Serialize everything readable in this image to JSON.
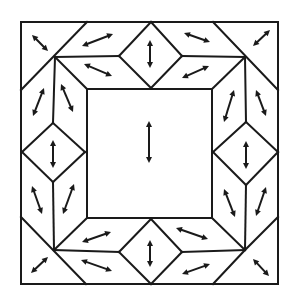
{
  "diagram": {
    "title": "",
    "colors": {
      "stroke": "#1a1a1a",
      "background": "#ffffff"
    },
    "outer_square": [
      21,
      22,
      278,
      284
    ],
    "inner_square": [
      87,
      89,
      212,
      218
    ],
    "lines": [
      [
        21,
        22,
        278,
        22
      ],
      [
        278,
        22,
        278,
        284
      ],
      [
        278,
        284,
        21,
        284
      ],
      [
        21,
        284,
        21,
        22
      ],
      [
        87,
        89,
        212,
        89
      ],
      [
        212,
        89,
        212,
        218
      ],
      [
        212,
        218,
        87,
        218
      ],
      [
        87,
        218,
        87,
        89
      ],
      [
        21,
        90,
        87,
        22
      ],
      [
        55,
        57,
        87,
        89
      ],
      [
        55,
        57,
        119,
        56
      ],
      [
        119,
        56,
        151,
        22
      ],
      [
        119,
        56,
        151,
        88
      ],
      [
        151,
        22,
        182,
        56
      ],
      [
        182,
        56,
        151,
        88
      ],
      [
        182,
        56,
        245,
        57
      ],
      [
        213,
        22,
        278,
        90
      ],
      [
        245,
        57,
        212,
        89
      ],
      [
        55,
        57,
        53,
        123
      ],
      [
        22,
        152,
        53,
        123
      ],
      [
        53,
        123,
        85,
        152
      ],
      [
        85,
        152,
        53,
        182
      ],
      [
        53,
        182,
        22,
        152
      ],
      [
        53,
        182,
        54,
        250
      ],
      [
        245,
        57,
        246,
        122
      ],
      [
        246,
        122,
        213,
        152
      ],
      [
        246,
        122,
        278,
        152
      ],
      [
        213,
        152,
        246,
        185
      ],
      [
        278,
        152,
        246,
        185
      ],
      [
        246,
        185,
        245,
        250
      ],
      [
        21,
        217,
        86,
        284
      ],
      [
        54,
        250,
        87,
        218
      ],
      [
        54,
        250,
        119,
        252
      ],
      [
        119,
        252,
        151,
        219
      ],
      [
        119,
        252,
        151,
        284
      ],
      [
        151,
        219,
        182,
        252
      ],
      [
        182,
        252,
        151,
        284
      ],
      [
        182,
        252,
        245,
        250
      ],
      [
        245,
        250,
        212,
        218
      ],
      [
        245,
        250,
        213,
        284
      ],
      [
        245,
        250,
        278,
        217
      ]
    ],
    "arrows": [
      {
        "tile": "corner-top-left",
        "from": [
          32,
          35
        ],
        "to": [
          48,
          51
        ]
      },
      {
        "tile": "top-left-outer",
        "from": [
          82,
          46
        ],
        "to": [
          113,
          34
        ]
      },
      {
        "tile": "top-left-inner",
        "from": [
          84,
          64
        ],
        "to": [
          112,
          76
        ]
      },
      {
        "tile": "top-diamond",
        "from": [
          150,
          40
        ],
        "to": [
          150,
          68
        ]
      },
      {
        "tile": "top-right-outer",
        "from": [
          184,
          33
        ],
        "to": [
          210,
          42
        ]
      },
      {
        "tile": "top-right-inner",
        "from": [
          182,
          78
        ],
        "to": [
          209,
          66
        ]
      },
      {
        "tile": "corner-top-right",
        "from": [
          253,
          46
        ],
        "to": [
          270,
          30
        ]
      },
      {
        "tile": "left-upper-outer",
        "from": [
          44,
          88
        ],
        "to": [
          33,
          116
        ]
      },
      {
        "tile": "left-upper-inner",
        "from": [
          61,
          84
        ],
        "to": [
          73,
          112
        ]
      },
      {
        "tile": "left-diamond",
        "from": [
          53,
          140
        ],
        "to": [
          53,
          168
        ]
      },
      {
        "tile": "left-lower-outer",
        "from": [
          32,
          186
        ],
        "to": [
          42,
          214
        ]
      },
      {
        "tile": "left-lower-inner",
        "from": [
          74,
          184
        ],
        "to": [
          63,
          214
        ]
      },
      {
        "tile": "corner-bottom-left",
        "from": [
          31,
          273
        ],
        "to": [
          48,
          257
        ]
      },
      {
        "tile": "bottom-left-inner",
        "from": [
          82,
          242
        ],
        "to": [
          111,
          232
        ]
      },
      {
        "tile": "bottom-left-outer",
        "from": [
          81,
          260
        ],
        "to": [
          112,
          271
        ]
      },
      {
        "tile": "bottom-diamond",
        "from": [
          150,
          240
        ],
        "to": [
          150,
          267
        ]
      },
      {
        "tile": "bottom-right-inner",
        "from": [
          176,
          228
        ],
        "to": [
          208,
          239
        ]
      },
      {
        "tile": "bottom-right-outer",
        "from": [
          182,
          274
        ],
        "to": [
          210,
          264
        ]
      },
      {
        "tile": "corner-bottom-right",
        "from": [
          253,
          259
        ],
        "to": [
          269,
          276
        ]
      },
      {
        "tile": "right-upper-outer",
        "from": [
          256,
          90
        ],
        "to": [
          266,
          116
        ]
      },
      {
        "tile": "right-upper-inner",
        "from": [
          234,
          90
        ],
        "to": [
          224,
          122
        ]
      },
      {
        "tile": "right-diamond",
        "from": [
          246,
          141
        ],
        "to": [
          246,
          169
        ]
      },
      {
        "tile": "right-lower-inner",
        "from": [
          224,
          189
        ],
        "to": [
          235,
          217
        ]
      },
      {
        "tile": "right-lower-outer",
        "from": [
          266,
          187
        ],
        "to": [
          256,
          216
        ]
      },
      {
        "tile": "center",
        "from": [
          149,
          121
        ],
        "to": [
          149,
          163
        ]
      }
    ]
  }
}
